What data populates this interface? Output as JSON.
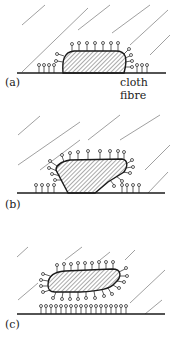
{
  "figure": {
    "panels": [
      {
        "id": "a",
        "label": "(a)",
        "annotation": "cloth fibre",
        "description": "Oily soil particle resting on cloth fibre, surfactant molecules adsorbed on fibre and soil surface"
      },
      {
        "id": "b",
        "label": "(b)",
        "description": "Soil particle being rolled up / lifted as surfactant penetrates underneath"
      },
      {
        "id": "c",
        "label": "(c)",
        "description": "Soil particle fully detached and suspended, surrounded by surfactant molecules; fibre coated with surfactant"
      }
    ],
    "colors": {
      "ink": "#1a1a1a",
      "hatch": "#555555",
      "diagonal_lines": "#777777",
      "background": "#ffffff"
    }
  }
}
